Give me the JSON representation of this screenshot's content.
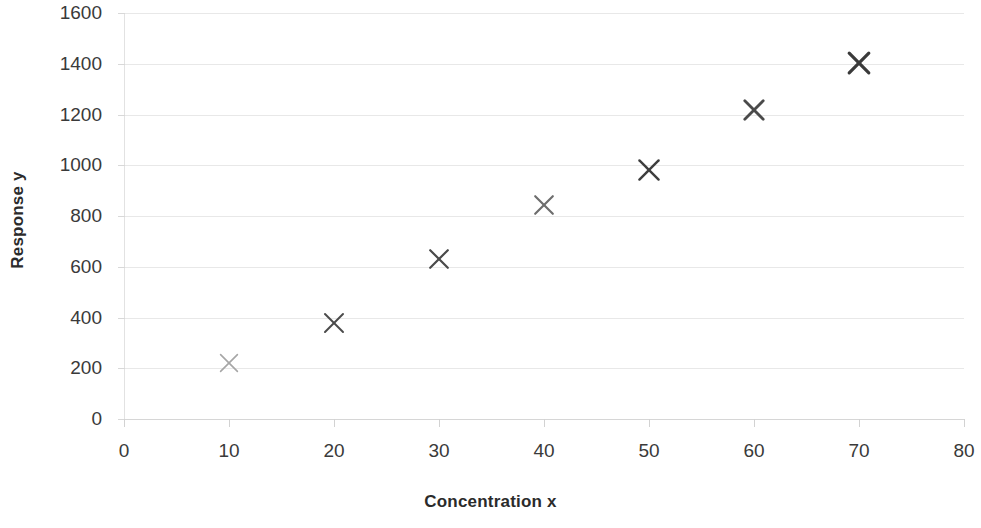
{
  "chart_data": {
    "type": "scatter",
    "title": "",
    "xlabel": "Concentration x",
    "ylabel": "Response y",
    "x": [
      10,
      20,
      30,
      40,
      50,
      60,
      70
    ],
    "values": [
      221,
      378,
      630,
      843,
      981,
      1217,
      1403
    ],
    "series": [
      {
        "name": "Response y",
        "x": [
          10,
          20,
          30,
          40,
          50,
          60,
          70
        ],
        "values": [
          221,
          378,
          630,
          843,
          981,
          1217,
          1403
        ]
      }
    ],
    "points": [
      {
        "x": 10,
        "y": 221,
        "marker": "x-cross",
        "color": "#a6a6a6",
        "size": 20,
        "stroke": 1.6
      },
      {
        "x": 20,
        "y": 378,
        "marker": "x-cross",
        "color": "#4a4a4a",
        "size": 22,
        "stroke": 2.0
      },
      {
        "x": 30,
        "y": 630,
        "marker": "x-cross",
        "color": "#4a4a4a",
        "size": 22,
        "stroke": 2.2
      },
      {
        "x": 40,
        "y": 843,
        "marker": "x-cross",
        "color": "#6e6e6e",
        "size": 22,
        "stroke": 2.2
      },
      {
        "x": 50,
        "y": 981,
        "marker": "x-cross",
        "color": "#3d3d3d",
        "size": 24,
        "stroke": 2.4
      },
      {
        "x": 60,
        "y": 1217,
        "marker": "x-cross",
        "color": "#4a4a4a",
        "size": 24,
        "stroke": 2.8
      },
      {
        "x": 70,
        "y": 1403,
        "marker": "x-cross",
        "color": "#3a3a3a",
        "size": 26,
        "stroke": 3.2
      }
    ],
    "xlim": [
      0,
      80
    ],
    "ylim": [
      0,
      1600
    ],
    "xticks": [
      0,
      10,
      20,
      30,
      40,
      50,
      60,
      70,
      80
    ],
    "yticks": [
      0,
      200,
      400,
      600,
      800,
      1000,
      1200,
      1400,
      1600
    ],
    "xtick_labels": [
      "0",
      "10",
      "20",
      "30",
      "40",
      "50",
      "60",
      "70",
      "80"
    ],
    "ytick_labels": [
      "0",
      "200",
      "400",
      "600",
      "800",
      "1000",
      "1200",
      "1400",
      "1600"
    ],
    "grid": true,
    "grid_axis": "y",
    "legend": false,
    "legend_position": "none",
    "background": "#ffffff",
    "gridline_color": "#e8e8e8",
    "axis_color": "#d6d6d6",
    "tick_label_color": "#3a3a3a",
    "axis_title_color": "#2b2b2b"
  }
}
